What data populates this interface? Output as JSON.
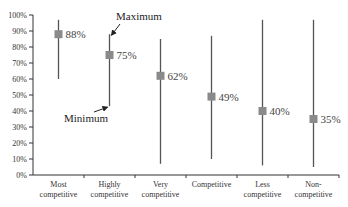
{
  "chart_data": {
    "type": "range-dot",
    "title": "",
    "xlabel": "",
    "ylabel": "",
    "ylim": [
      0,
      100
    ],
    "y_ticks": [
      "0%",
      "10%",
      "20%",
      "30%",
      "40%",
      "50%",
      "60%",
      "70%",
      "80%",
      "90%",
      "100%"
    ],
    "grid": false,
    "legend": null,
    "categories": [
      {
        "label_lines": [
          "Most",
          "competitive"
        ],
        "value": 88,
        "value_label": "88%",
        "min": 60,
        "max": 97
      },
      {
        "label_lines": [
          "Highly",
          "competitive"
        ],
        "value": 75,
        "value_label": "75%",
        "min": 43,
        "max": 88
      },
      {
        "label_lines": [
          "Very",
          "competitive"
        ],
        "value": 62,
        "value_label": "62%",
        "min": 7,
        "max": 85
      },
      {
        "label_lines": [
          "Competitive"
        ],
        "value": 49,
        "value_label": "49%",
        "min": 10,
        "max": 87
      },
      {
        "label_lines": [
          "Less",
          "competitive"
        ],
        "value": 40,
        "value_label": "40%",
        "min": 6,
        "max": 97
      },
      {
        "label_lines": [
          "Non-",
          "competitive"
        ],
        "value": 35,
        "value_label": "35%",
        "min": 5,
        "max": 97
      }
    ],
    "annotations": [
      {
        "text": "Maximum",
        "points_to": "Highly competitive max"
      },
      {
        "text": "Minimum",
        "points_to": "Highly competitive min"
      }
    ],
    "colors": {
      "range_line": "#555555",
      "marker": "#8a8a8a",
      "axis": "#333333"
    }
  }
}
